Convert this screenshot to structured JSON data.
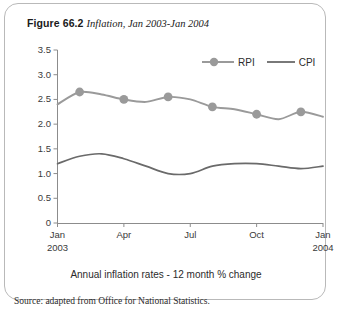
{
  "figure": {
    "label": "Figure 66.2",
    "subtitle": "Inflation, Jan 2003-Jan 2004",
    "caption": "Annual inflation rates - 12 month % change",
    "source": "Source: adapted from Office for National Statistics."
  },
  "colors": {
    "rpi": "#9a9a9a",
    "cpi": "#6a6a6a",
    "axis": "#8c8c8c",
    "border": "#b9b9b9",
    "text": "#2b2b2b"
  },
  "chart_data": {
    "type": "line",
    "title": "Inflation, Jan 2003-Jan 2004",
    "subtitle": "Annual inflation rates - 12 month % change",
    "xlabel": "",
    "ylabel": "",
    "ylim": [
      0,
      3.5
    ],
    "yticks": [
      "0",
      "0.5",
      "1.0",
      "1.5",
      "2.0",
      "2.5",
      "3.0",
      "3.5"
    ],
    "ytick_values": [
      0,
      0.5,
      1.0,
      1.5,
      2.0,
      2.5,
      3.0,
      3.5
    ],
    "grid": false,
    "legend_position": "top-right",
    "x": [
      "Jan 2003",
      "Feb 2003",
      "Mar 2003",
      "Apr 2003",
      "May 2003",
      "Jun 2003",
      "Jul 2003",
      "Aug 2003",
      "Sep 2003",
      "Oct 2003",
      "Nov 2003",
      "Dec 2003",
      "Jan 2004"
    ],
    "xticks": [
      {
        "label": "Jan",
        "year": "2003",
        "index": 0
      },
      {
        "label": "Apr",
        "year": "",
        "index": 3
      },
      {
        "label": "Jul",
        "year": "",
        "index": 6
      },
      {
        "label": "Oct",
        "year": "",
        "index": 9
      },
      {
        "label": "Jan",
        "year": "2004",
        "index": 12
      }
    ],
    "series": [
      {
        "name": "RPI",
        "marker": "circle",
        "values": [
          2.4,
          2.65,
          2.6,
          2.5,
          2.45,
          2.55,
          2.5,
          2.35,
          2.3,
          2.2,
          2.1,
          2.25,
          2.15
        ]
      },
      {
        "name": "CPI",
        "marker": "none",
        "values": [
          1.2,
          1.35,
          1.4,
          1.3,
          1.15,
          1.0,
          1.0,
          1.15,
          1.2,
          1.2,
          1.15,
          1.1,
          1.15
        ]
      }
    ]
  }
}
